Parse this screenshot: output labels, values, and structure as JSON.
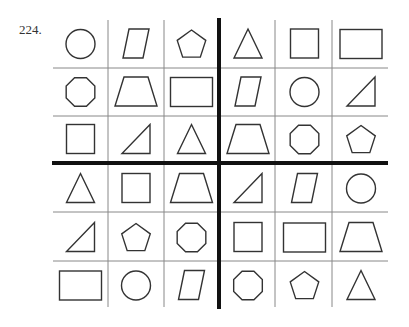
{
  "problem_number": "224.",
  "grid": {
    "rows": 6,
    "cols": 6,
    "cells": [
      [
        "circle",
        "parallelogram",
        "pentagon",
        "triangle",
        "square",
        "rectangle"
      ],
      [
        "octagon",
        "trapezoid",
        "rectangle",
        "parallelogram",
        "circle",
        "right-triangle"
      ],
      [
        "square",
        "right-triangle",
        "triangle",
        "trapezoid",
        "octagon",
        "pentagon"
      ],
      [
        "triangle",
        "square",
        "trapezoid",
        "right-triangle",
        "parallelogram",
        "circle"
      ],
      [
        "right-triangle",
        "pentagon",
        "octagon",
        "square",
        "rectangle",
        "trapezoid"
      ],
      [
        "rectangle",
        "circle",
        "parallelogram",
        "octagon",
        "pentagon",
        "triangle"
      ]
    ],
    "stroke_color": "#333333",
    "line_color": "#888888",
    "divider_color": "#111111"
  }
}
